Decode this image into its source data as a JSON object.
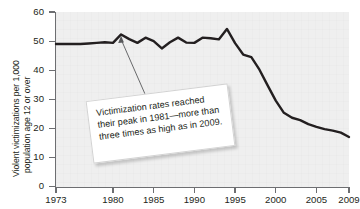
{
  "chart_data": {
    "type": "line",
    "title": "",
    "xlabel": "",
    "ylabel": "Violent victimizations per 1,000 population age 12 or over",
    "ylabel_line1": "Violent victimizations per 1,000",
    "ylabel_line2": "population age 12 or over",
    "xlim": [
      1973,
      2009
    ],
    "ylim": [
      0,
      60
    ],
    "grid": false,
    "legend": false,
    "y_ticks": [
      0,
      10,
      20,
      30,
      40,
      50,
      60
    ],
    "y_tick_labels": [
      "0",
      "10",
      "20",
      "30",
      "40",
      "50",
      "60"
    ],
    "x_ticks": [
      1973,
      1980,
      1985,
      1990,
      1995,
      2000,
      2005,
      2009
    ],
    "x_tick_labels": [
      "1973",
      "1980",
      "1985",
      "1990",
      "1995",
      "2000",
      "2005",
      "2009"
    ],
    "series": [
      {
        "name": "Violent victimization rate",
        "color": "#231f20",
        "x": [
          1973,
          1974,
          1975,
          1976,
          1977,
          1978,
          1979,
          1980,
          1981,
          1982,
          1983,
          1984,
          1985,
          1986,
          1987,
          1988,
          1989,
          1990,
          1991,
          1992,
          1993,
          1994,
          1995,
          1996,
          1997,
          1998,
          1999,
          2000,
          2001,
          2002,
          2003,
          2004,
          2005,
          2006,
          2007,
          2008,
          2009
        ],
        "values": [
          49.0,
          49.0,
          49.0,
          49.0,
          49.2,
          49.4,
          49.6,
          49.4,
          52.3,
          50.7,
          49.4,
          51.2,
          50.0,
          47.5,
          49.6,
          51.2,
          49.5,
          49.4,
          51.2,
          51.0,
          50.6,
          54.2,
          49.3,
          45.4,
          44.5,
          40.2,
          34.8,
          29.6,
          25.4,
          23.7,
          22.9,
          21.5,
          20.6,
          19.8,
          19.3,
          18.6,
          17.1
        ]
      }
    ],
    "annotation": {
      "text": "Victimization rates reached their peak in 1981—more than three times as high as in 2009.",
      "points_to_year": 1981,
      "points_to_value": 52.3
    }
  },
  "colors": {
    "line": "#231f20",
    "plot_background": "#efefef",
    "axis": "#6d6e71",
    "text": "#231f20",
    "callout_background": "#ffffff",
    "callout_border": "#d3d3d3"
  }
}
